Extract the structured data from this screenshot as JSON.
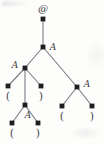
{
  "figure": {
    "kind": "parse-tree-diagram",
    "width": 105,
    "height": 145,
    "colors": {
      "background": "#fdfdfb",
      "node": "#1d1d22",
      "edge": "#7a7a84",
      "label": "#3c3c42"
    },
    "nodes": [
      {
        "id": "root",
        "x": 43,
        "y": 19,
        "label": "",
        "label_x": 43,
        "label_y": 9,
        "label_kind": "at"
      },
      {
        "id": "n-a-top",
        "x": 43,
        "y": 47,
        "label": "A",
        "label_x": 53,
        "label_y": 47,
        "label_kind": "nonterminal"
      },
      {
        "id": "n-a-left",
        "x": 25,
        "y": 68,
        "label": "A",
        "label_x": 15,
        "label_y": 65,
        "label_kind": "nonterminal"
      },
      {
        "id": "leaf-l-open",
        "x": 8,
        "y": 86,
        "label": "(",
        "label_x": 8,
        "label_y": 96,
        "label_kind": "terminal"
      },
      {
        "id": "n-a-mid",
        "x": 25,
        "y": 105,
        "label": "A",
        "label_x": 28,
        "label_y": 115,
        "label_kind": "nonterminal"
      },
      {
        "id": "leaf-l-close",
        "x": 41,
        "y": 86,
        "label": ")",
        "label_x": 41,
        "label_y": 96,
        "label_kind": "terminal"
      },
      {
        "id": "leaf-m-open",
        "x": 12,
        "y": 123,
        "label": "(",
        "label_x": 12,
        "label_y": 133,
        "label_kind": "terminal"
      },
      {
        "id": "leaf-m-close",
        "x": 38,
        "y": 123,
        "label": ")",
        "label_x": 38,
        "label_y": 133,
        "label_kind": "terminal"
      },
      {
        "id": "n-a-right",
        "x": 77,
        "y": 87,
        "label": "A",
        "label_x": 87,
        "label_y": 84,
        "label_kind": "nonterminal"
      },
      {
        "id": "leaf-r-open",
        "x": 62,
        "y": 106,
        "label": "(",
        "label_x": 62,
        "label_y": 116,
        "label_kind": "terminal"
      },
      {
        "id": "leaf-r-close",
        "x": 92,
        "y": 106,
        "label": ")",
        "label_x": 92,
        "label_y": 116,
        "label_kind": "terminal"
      }
    ],
    "edges": [
      {
        "from": "root",
        "to": "n-a-top"
      },
      {
        "from": "n-a-top",
        "to": "n-a-left"
      },
      {
        "from": "n-a-top",
        "to": "n-a-right"
      },
      {
        "from": "n-a-left",
        "to": "leaf-l-open"
      },
      {
        "from": "n-a-left",
        "to": "n-a-mid"
      },
      {
        "from": "n-a-left",
        "to": "leaf-l-close"
      },
      {
        "from": "n-a-mid",
        "to": "leaf-m-open"
      },
      {
        "from": "n-a-mid",
        "to": "leaf-m-close"
      },
      {
        "from": "n-a-right",
        "to": "leaf-r-open"
      },
      {
        "from": "n-a-right",
        "to": "leaf-r-close"
      }
    ],
    "at_symbol": "@"
  }
}
